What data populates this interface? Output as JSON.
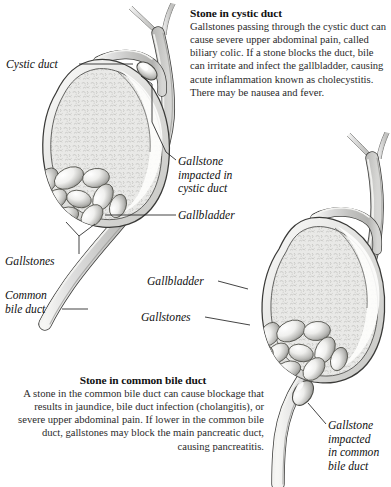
{
  "figure": {
    "title_top": "Stone in cystic duct",
    "title_bottom": "Stone in common bile duct"
  },
  "top_block": {
    "heading": "Stone in cystic duct",
    "body": "Gallstones passing through the cystic duct can cause severe upper abdominal pain, called biliary colic. If a stone blocks the duct, bile can irritate and infect the gallbladder, causing acute inflammation known as cholecystitis. There may be nausea and fever."
  },
  "bottom_block": {
    "heading": "Stone in common bile duct",
    "body": "A stone in the common bile duct can cause blockage that results in jaundice, bile duct infection (cholangitis), or severe upper abdominal pain. If lower in the common bile duct, gallstones may block the main pancreatic duct, causing pancreatitis."
  },
  "labels": {
    "cystic_duct": "Cystic duct",
    "gallstone_impacted_cystic_l1": "Gallstone",
    "gallstone_impacted_cystic_l2": "impacted in",
    "gallstone_impacted_cystic_l3": "cystic duct",
    "gallbladder_1": "Gallbladder",
    "gallstones_1": "Gallstones",
    "common_bile_duct_l1": "Common",
    "common_bile_duct_l2": "bile duct",
    "gallbladder_2": "Gallbladder",
    "gallstones_2": "Gallstones",
    "gallstone_impacted_cbd_l1": "Gallstone",
    "gallstone_impacted_cbd_l2": "impacted",
    "gallstone_impacted_cbd_l3": "in common",
    "gallstone_impacted_cbd_l4": "bile duct"
  },
  "colors": {
    "background": "#ffffff",
    "ink": "#1a1a1a",
    "organ_fill": "#e6e6e4",
    "organ_fill_light": "#f2f2f0",
    "duct_fill": "#cfcfcd",
    "duct_highlight": "#f4f4f2",
    "stone_light": "#fbfbfa",
    "stone_shadow": "#8e8e8c",
    "outline": "#3a3a3a",
    "leader": "#222222"
  }
}
